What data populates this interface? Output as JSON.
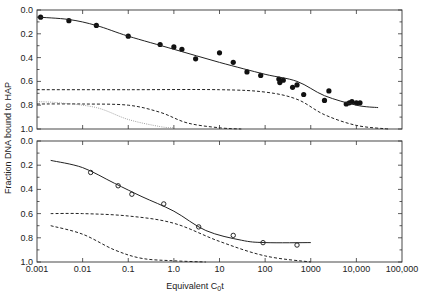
{
  "chart_data": [
    {
      "type": "scatter",
      "panel": "top",
      "xscale": "log",
      "xlim": [
        0.001,
        100000
      ],
      "ylim": [
        0.0,
        1.0
      ],
      "yinverted": true,
      "ylabel": "Fraction DNA bound to HAP",
      "xlabel": "Equivalent C0t",
      "yticks": [
        "0.0",
        "0.2",
        "0.4",
        "0.6",
        "0.8",
        "1.0"
      ],
      "series": [
        {
          "name": "observed (filled circles)",
          "marker": "filled-circle",
          "x": [
            0.0012,
            0.005,
            0.02,
            0.1,
            0.5,
            1.0,
            1.5,
            3.0,
            10,
            20,
            40,
            80,
            200,
            210,
            250,
            400,
            500,
            700,
            2000,
            2500,
            6000,
            7000,
            8000,
            10000,
            12000
          ],
          "y": [
            0.06,
            0.09,
            0.13,
            0.22,
            0.29,
            0.31,
            0.33,
            0.41,
            0.36,
            0.44,
            0.52,
            0.55,
            0.58,
            0.61,
            0.59,
            0.65,
            0.63,
            0.71,
            0.76,
            0.68,
            0.79,
            0.78,
            0.77,
            0.78,
            0.78
          ]
        },
        {
          "name": "fit (solid)",
          "style": "solid",
          "x": [
            0.001,
            0.005,
            0.02,
            0.1,
            1,
            10,
            100,
            500,
            2000,
            10000,
            30000
          ],
          "y": [
            0.06,
            0.08,
            0.13,
            0.22,
            0.33,
            0.44,
            0.54,
            0.6,
            0.72,
            0.8,
            0.82
          ]
        },
        {
          "name": "component 1 (dashed)",
          "style": "dashed",
          "x": [
            0.001,
            0.1,
            10,
            100,
            500,
            2000,
            10000,
            50000
          ],
          "y": [
            0.67,
            0.67,
            0.67,
            0.69,
            0.75,
            0.88,
            0.97,
            1.0
          ]
        },
        {
          "name": "component 2 (dashed)",
          "style": "dashed",
          "x": [
            0.001,
            0.01,
            0.1,
            0.5,
            2,
            10,
            30
          ],
          "y": [
            0.79,
            0.79,
            0.8,
            0.86,
            0.95,
            0.99,
            1.0
          ]
        },
        {
          "name": "component 3 (dotted)",
          "style": "dotted",
          "x": [
            0.001,
            0.003,
            0.02,
            0.1,
            0.5,
            1.0
          ],
          "y": [
            0.77,
            0.78,
            0.82,
            0.92,
            0.98,
            0.99
          ]
        }
      ]
    },
    {
      "type": "scatter",
      "panel": "bottom",
      "xscale": "log",
      "xlim": [
        0.001,
        100000
      ],
      "ylim": [
        0.0,
        1.0
      ],
      "yinverted": true,
      "ylabel": "Fraction DNA bound to HAP",
      "xlabel": "Equivalent C0t",
      "yticks": [
        "0.0",
        "0.2",
        "0.4",
        "0.6",
        "0.8",
        "1.0"
      ],
      "xticks": [
        "0.001",
        "0.01",
        "0.1",
        "1.0",
        "10",
        "100",
        "1000",
        "10,000",
        "100,000"
      ],
      "series": [
        {
          "name": "observed (open circles)",
          "marker": "open-circle",
          "x": [
            0.015,
            0.06,
            0.12,
            0.6,
            3.5,
            20,
            90,
            500
          ],
          "y": [
            0.26,
            0.37,
            0.44,
            0.52,
            0.71,
            0.78,
            0.84,
            0.86
          ]
        },
        {
          "name": "fit (solid)",
          "style": "solid",
          "x": [
            0.002,
            0.01,
            0.05,
            0.2,
            1,
            5,
            30,
            100,
            1000
          ],
          "y": [
            0.16,
            0.22,
            0.35,
            0.46,
            0.58,
            0.74,
            0.82,
            0.84,
            0.84
          ]
        },
        {
          "name": "component 1 (dashed)",
          "style": "dashed",
          "x": [
            0.002,
            0.01,
            0.1,
            1,
            10,
            100,
            1000
          ],
          "y": [
            0.6,
            0.6,
            0.62,
            0.68,
            0.83,
            0.95,
            1.0
          ]
        },
        {
          "name": "component 2 (dashed)",
          "style": "dashed",
          "x": [
            0.002,
            0.01,
            0.05,
            0.2,
            1,
            5
          ],
          "y": [
            0.7,
            0.77,
            0.9,
            0.97,
            0.99,
            1.0
          ]
        }
      ]
    }
  ],
  "axes": {
    "ylabel": "Fraction DNA bound to HAP",
    "xlabel_main": "Equivalent C",
    "xlabel_sub": "0",
    "xlabel_tail": "t",
    "yticks": [
      "0.0",
      "0.2",
      "0.4",
      "0.6",
      "0.8",
      "1.0"
    ],
    "xticks": [
      "0.001",
      "0.01",
      "0.1",
      "1.0",
      "10",
      "100",
      "1000",
      "10,000",
      "100,000"
    ]
  }
}
